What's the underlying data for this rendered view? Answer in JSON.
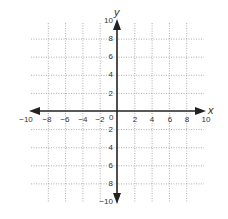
{
  "chart_data": {
    "type": "scatter",
    "title": "",
    "xlabel": "x",
    "ylabel": "y",
    "xlim": [
      -10,
      10
    ],
    "ylim": [
      -10,
      10
    ],
    "grid": true,
    "grid_step": 2,
    "x_ticks": [
      "-10",
      "-8",
      "-6",
      "-4",
      "-2",
      "0",
      "2",
      "4",
      "6",
      "8",
      "10"
    ],
    "y_ticks": [
      "10",
      "8",
      "6",
      "4",
      "2",
      "2",
      "4",
      "6",
      "8",
      "-10"
    ],
    "series": [],
    "origin_label": "0",
    "colors": {
      "axis": "#222222",
      "grid": "#999999",
      "text": "#333333"
    }
  },
  "labels": {
    "x_axis": "x",
    "y_axis": "y",
    "origin": "0",
    "x_ticks": [
      {
        "text": "−10",
        "x": 26
      },
      {
        "text": "−8",
        "x": 47
      },
      {
        "text": "−6",
        "x": 65
      },
      {
        "text": "−4",
        "x": 83
      },
      {
        "text": "−2",
        "x": 100
      },
      {
        "text": "2",
        "x": 135
      },
      {
        "text": "4",
        "x": 152
      },
      {
        "text": "6",
        "x": 170
      },
      {
        "text": "8",
        "x": 187
      },
      {
        "text": "10",
        "x": 206
      }
    ],
    "y_ticks": [
      {
        "text": "10",
        "y": 23
      },
      {
        "text": "8",
        "y": 41
      },
      {
        "text": "6",
        "y": 59
      },
      {
        "text": "4",
        "y": 77
      },
      {
        "text": "2",
        "y": 96
      },
      {
        "text": "2",
        "y": 132
      },
      {
        "text": "4",
        "y": 150
      },
      {
        "text": "6",
        "y": 168
      },
      {
        "text": "8",
        "y": 186
      },
      {
        "text": "−10",
        "y": 204
      }
    ]
  }
}
